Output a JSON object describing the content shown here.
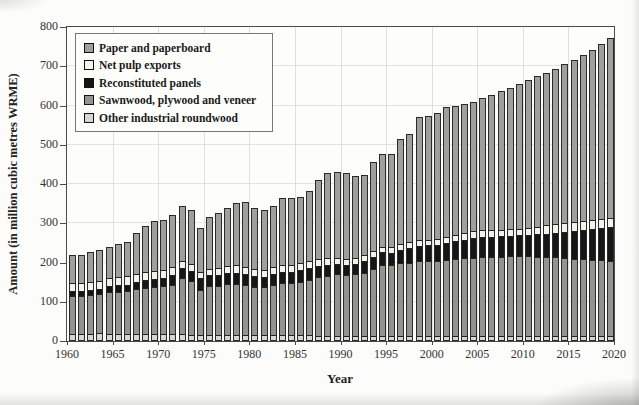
{
  "chart_data": {
    "type": "bar",
    "stacked": true,
    "title": "",
    "xlabel": "Year",
    "ylabel": "Amount (in million cubic metres WRME)",
    "ylim": [
      0,
      800
    ],
    "yticks": [
      0,
      100,
      200,
      300,
      400,
      500,
      600,
      700,
      800
    ],
    "xticks": [
      1960,
      1965,
      1970,
      1975,
      1980,
      1985,
      1990,
      1995,
      2000,
      2005,
      2010,
      2015,
      2020
    ],
    "grid": true,
    "legend_position": "top-left-inside",
    "years": [
      1961,
      1962,
      1963,
      1964,
      1965,
      1966,
      1967,
      1968,
      1969,
      1970,
      1971,
      1972,
      1973,
      1974,
      1975,
      1976,
      1977,
      1978,
      1979,
      1980,
      1981,
      1982,
      1983,
      1984,
      1985,
      1986,
      1987,
      1988,
      1989,
      1990,
      1991,
      1992,
      1993,
      1994,
      1995,
      1996,
      1997,
      1998,
      1999,
      2000,
      2001,
      2002,
      2003,
      2004,
      2005,
      2006,
      2007,
      2008,
      2009,
      2010,
      2011,
      2012,
      2013,
      2014,
      2015,
      2016,
      2017,
      2018,
      2019,
      2020
    ],
    "series": [
      {
        "name": "Other industrial roundwood",
        "color": "#d7d6d0",
        "values": [
          15,
          15,
          15,
          15,
          15,
          14,
          14,
          14,
          13,
          13,
          13,
          13,
          13,
          12,
          12,
          12,
          12,
          11,
          11,
          11,
          11,
          10,
          10,
          10,
          10,
          10,
          10,
          9,
          9,
          8,
          8,
          8,
          8,
          8,
          8,
          8,
          8,
          8,
          8,
          8,
          8,
          8,
          8,
          8,
          8,
          8,
          8,
          8,
          8,
          8,
          8,
          8,
          8,
          8,
          8,
          8,
          8,
          8,
          8,
          8
        ]
      },
      {
        "name": "Sawnwood, plywood and veneer",
        "color": "#94948e",
        "values": [
          100,
          100,
          102,
          105,
          110,
          112,
          113,
          118,
          122,
          125,
          127,
          130,
          146,
          140,
          118,
          126,
          128,
          132,
          133,
          131,
          126,
          126,
          131,
          136,
          137,
          140,
          145,
          152,
          155,
          160,
          158,
          160,
          165,
          175,
          185,
          183,
          188,
          190,
          193,
          193,
          194,
          197,
          199,
          200,
          202,
          203,
          204,
          204,
          205,
          206,
          205,
          204,
          203,
          203,
          200,
          198,
          197,
          195,
          194,
          192
        ]
      },
      {
        "name": "Reconstituted panels",
        "color": "#161616",
        "values": [
          10,
          10,
          11,
          11,
          13,
          14,
          15,
          16,
          17,
          17,
          19,
          22,
          26,
          24,
          29,
          27,
          27,
          27,
          27,
          26,
          25,
          25,
          26,
          27,
          27,
          27,
          27,
          27,
          26,
          25,
          25,
          26,
          27,
          28,
          30,
          31,
          33,
          35,
          37,
          39,
          40,
          42,
          44,
          46,
          50,
          50,
          50,
          51,
          51,
          51,
          53,
          56,
          58,
          60,
          65,
          69,
          73,
          77,
          81,
          85
        ]
      },
      {
        "name": "Net pulp exports",
        "color": "#f2f1ea",
        "values": [
          19,
          19,
          19,
          20,
          21,
          20,
          20,
          20,
          20,
          19,
          19,
          19,
          15,
          16,
          13,
          14,
          15,
          16,
          17,
          17,
          16,
          16,
          16,
          17,
          16,
          16,
          16,
          16,
          15,
          13,
          13,
          13,
          13,
          13,
          12,
          13,
          13,
          13,
          13,
          12,
          13,
          13,
          14,
          14,
          15,
          16,
          16,
          15,
          14,
          13,
          15,
          17,
          19,
          20,
          22,
          22,
          22,
          22,
          22,
          22
        ]
      },
      {
        "name": "Paper and paperboard",
        "color": "#a0a09b",
        "values": [
          76,
          76,
          79,
          81,
          81,
          87,
          90,
          107,
          120,
          131,
          130,
          138,
          145,
          141,
          115,
          136,
          143,
          154,
          164,
          170,
          160,
          156,
          162,
          175,
          175,
          175,
          183,
          205,
          222,
          224,
          224,
          214,
          210,
          231,
          242,
          242,
          273,
          281,
          319,
          322,
          327,
          335,
          335,
          337,
          335,
          341,
          349,
          358,
          367,
          377,
          383,
          389,
          396,
          403,
          410,
          419,
          428,
          439,
          452,
          466
        ]
      }
    ],
    "legend": [
      {
        "label": "Paper and paperboard",
        "color": "#a0a09b"
      },
      {
        "label": "Net pulp exports",
        "color": "#f2f1ea"
      },
      {
        "label": "Reconstituted panels",
        "color": "#161616"
      },
      {
        "label": "Sawnwood, plywood and veneer",
        "color": "#94948e"
      },
      {
        "label": "Other industrial roundwood",
        "color": "#d7d6d0"
      }
    ]
  }
}
